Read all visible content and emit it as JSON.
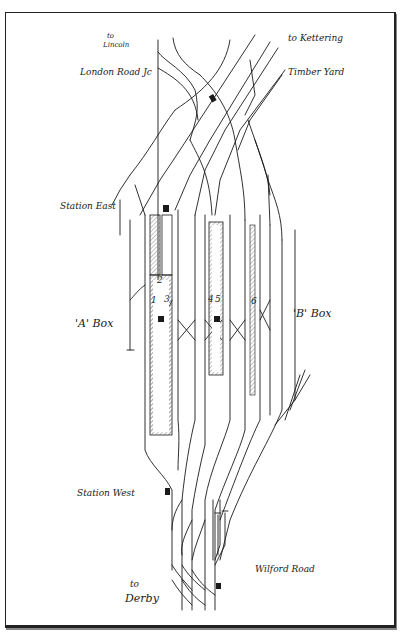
{
  "diagram": {
    "labels": {
      "to_lincoln": "to\nLincoln",
      "to_lincoln_line1": "to",
      "to_lincoln_line2": "Lincoln",
      "london_road_jc": "London Road Jc",
      "to_kettering": "to Kettering",
      "timber_yard": "Timber Yard",
      "station_east": "Station East",
      "a_box": "'A' Box",
      "b_box": "'B' Box",
      "station_west": "Station West",
      "wilford_road": "Wilford Road",
      "to_derby_line1": "to",
      "to_derby_line2": "Derby"
    },
    "platform_numbers": [
      "1",
      "2",
      "3",
      "4",
      "5",
      "6"
    ],
    "colors": {
      "line": "#1a1a1a",
      "background": "#ffffff",
      "platform_hatch": "#777777"
    }
  }
}
